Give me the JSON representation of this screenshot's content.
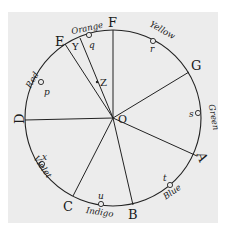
{
  "diagram": {
    "center": {
      "label": "O",
      "x": 113,
      "y": 118
    },
    "radius": 88,
    "points": [
      {
        "label": "F",
        "x": 113,
        "y": 30
      },
      {
        "label": "G",
        "x": 189,
        "y": 71
      },
      {
        "label": "A",
        "x": 198,
        "y": 157
      },
      {
        "label": "B",
        "x": 133,
        "y": 204
      },
      {
        "label": "C",
        "x": 72,
        "y": 196
      },
      {
        "label": "D",
        "x": 25,
        "y": 120
      },
      {
        "label": "E",
        "x": 65,
        "y": 44
      }
    ],
    "inner_points": [
      {
        "label": "Y",
        "x": 80,
        "y": 42
      },
      {
        "label": "Z",
        "x": 97,
        "y": 82
      }
    ],
    "colors": [
      {
        "name": "Red",
        "marker": "p"
      },
      {
        "name": "Orange",
        "marker": "q"
      },
      {
        "name": "Yellow",
        "marker": "r"
      },
      {
        "name": "Green",
        "marker": "s"
      },
      {
        "name": "Blue",
        "marker": "t"
      },
      {
        "name": "Indigo",
        "marker": "u"
      },
      {
        "name": "Violet",
        "marker": "x"
      }
    ]
  }
}
